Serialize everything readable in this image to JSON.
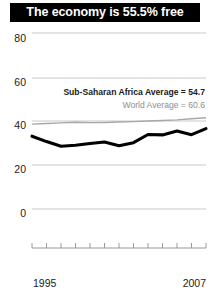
{
  "title": {
    "text": "The economy is 55.5% free"
  },
  "annotations": {
    "africa_label": "Sub-Saharan Africa Average = 54.7",
    "world_label": "World Average = 60.6"
  },
  "axis": {
    "y_ticks": [
      "0",
      "20",
      "40",
      "60",
      "80",
      "100"
    ],
    "x_start": "1995",
    "x_end": "2007"
  },
  "colors": {
    "title_bar": "#000000",
    "title_text": "#ffffff",
    "africa_line": "#000000",
    "world_line": "#a8a8a8",
    "gridline": "#c9c9c9",
    "axis_text": "#1a1a1a",
    "world_text": "#8d8d8d"
  },
  "chart_data": {
    "type": "line",
    "title": "The economy is 55.5% free",
    "xlabel": "",
    "ylabel": "",
    "xlim": [
      1995,
      2007
    ],
    "ylim": [
      0,
      100
    ],
    "y_ticks": [
      0,
      20,
      40,
      60,
      80,
      100
    ],
    "grid": true,
    "legend": "none",
    "x": [
      1995,
      1996,
      1997,
      1998,
      1999,
      2000,
      2001,
      2002,
      2003,
      2004,
      2005,
      2006,
      2007
    ],
    "series": [
      {
        "name": "Sub-Saharan Africa Average",
        "color": "#000000",
        "average": 54.7,
        "values": [
          52.0,
          49.5,
          47.3,
          47.8,
          48.6,
          49.3,
          47.6,
          49.0,
          52.8,
          52.6,
          54.4,
          52.7,
          55.5
        ]
      },
      {
        "name": "World Average",
        "color": "#a8a8a8",
        "average": 60.6,
        "values": [
          57.6,
          57.9,
          58.2,
          58.5,
          58.3,
          58.4,
          58.6,
          58.8,
          59.1,
          59.3,
          59.6,
          60.1,
          60.6
        ]
      }
    ]
  }
}
